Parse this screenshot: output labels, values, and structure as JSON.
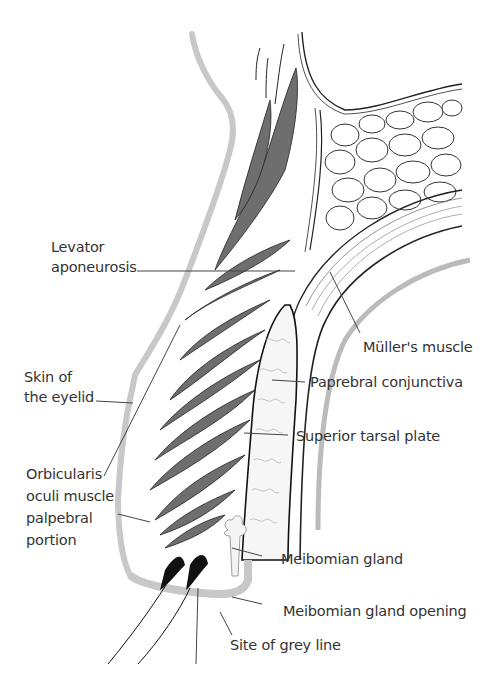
{
  "diagram": {
    "colors": {
      "skin_outline": "#c8c8c8",
      "muscle_fill": "#777777",
      "line": "#222222",
      "gland_fill": "#f4f4f4",
      "text": "#333333"
    },
    "labels": {
      "levator_line1": "Levator",
      "levator_line2": "aponeurosis",
      "skin_line1": "Skin of",
      "skin_line2": "the eyelid",
      "orbicularis_line1": "Orbicularis",
      "orbicularis_line2": "oculi muscle",
      "orbicularis_line3": "palpebral",
      "orbicularis_line4": "portion",
      "muller": "Müller's muscle",
      "conjunctiva": "Paprebral conjunctiva",
      "tarsal": "Superior tarsal plate",
      "meibomian": "Meibomian gland",
      "meibomian_opening": "Meibomian gland opening",
      "grey_line": "Site of grey line"
    }
  }
}
